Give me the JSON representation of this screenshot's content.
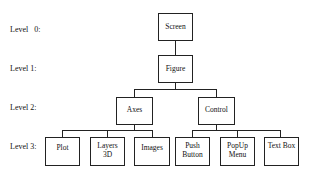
{
  "levels": [
    {
      "label": "Level   0:"
    },
    {
      "label": "Level 1:"
    },
    {
      "label": "Level 2:"
    },
    {
      "label": "Level 3:"
    }
  ],
  "nodes": {
    "screen": {
      "label": "Screen",
      "level": 0
    },
    "figure": {
      "label": "Figure",
      "level": 1
    },
    "axes": {
      "label": "Axes",
      "level": 2
    },
    "control": {
      "label": "Control",
      "level": 2
    },
    "plot": {
      "label": "Plot",
      "level": 3
    },
    "layers3d": {
      "line1": "Layers",
      "line2": "3D",
      "level": 3
    },
    "images": {
      "label": "Images",
      "level": 3
    },
    "push_button": {
      "line1": "Push",
      "line2": "Button",
      "level": 3
    },
    "popup_menu": {
      "line1": "PopUp",
      "line2": "Menu",
      "level": 3
    },
    "text_box": {
      "label": "Text Box",
      "level": 3
    }
  },
  "edges": [
    [
      "screen",
      "figure"
    ],
    [
      "figure",
      "axes"
    ],
    [
      "figure",
      "control"
    ],
    [
      "axes",
      "plot"
    ],
    [
      "axes",
      "layers3d"
    ],
    [
      "axes",
      "images"
    ],
    [
      "control",
      "push_button"
    ],
    [
      "control",
      "popup_menu"
    ],
    [
      "control",
      "text_box"
    ]
  ]
}
